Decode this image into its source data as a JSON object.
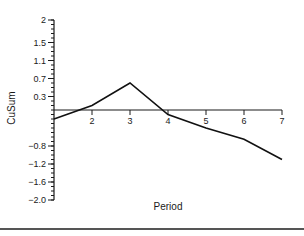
{
  "chart_data": {
    "type": "line",
    "title": "",
    "xlabel": "Period",
    "ylabel": "CuSum",
    "x": [
      1,
      2,
      3,
      4,
      5,
      6,
      7
    ],
    "series": [
      {
        "name": "CuSum",
        "values": [
          -0.2,
          0.1,
          0.6,
          -0.1,
          -0.4,
          -0.65,
          -1.1
        ]
      }
    ],
    "xlim": [
      1,
      7
    ],
    "ylim": [
      -2.0,
      2.0
    ],
    "x_ticks": [
      2,
      3,
      4,
      5,
      6,
      7
    ],
    "x_tick_labels": [
      "2",
      "3",
      "4",
      "5",
      "6",
      "7"
    ],
    "y_ticks": [
      2,
      1.5,
      1.1,
      0.7,
      0.3,
      -0.8,
      -1.2,
      -1.6,
      -2.0
    ],
    "y_tick_labels": [
      "2",
      "1.5",
      "1.1",
      "0.7",
      "0.3",
      "−0.8",
      "−1.2",
      "−1.6",
      "−2.0"
    ],
    "y_minor_tick_step": 0.1,
    "x_axis_at_y": 0,
    "grid": false,
    "legend": "none",
    "colors": {
      "line": "#111111",
      "axis": "#1a1a1a"
    }
  }
}
